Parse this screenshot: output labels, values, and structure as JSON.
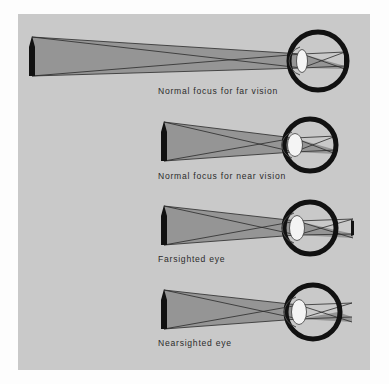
{
  "figure": {
    "panel_background": "#c9c9c9",
    "page_background": "#fdfdfd",
    "ink_color": "#1a1a1a",
    "ray_fill_color": "#8c8c8c",
    "lens_color": "#f4f4f4"
  },
  "diagrams": [
    {
      "id": "normal-far",
      "caption": "Normal focus for far vision",
      "object": {
        "x": 30,
        "top": 36,
        "bottom": 76,
        "label": "upright object (arrow)"
      },
      "eye": {
        "cx": 318,
        "cy": 61,
        "r": 31
      },
      "lens": {
        "cx": 290,
        "cy": 61,
        "rx": 5.5,
        "ry": 12,
        "shape": "thin"
      },
      "image_on_retina": {
        "x": 344,
        "top": 53,
        "bottom": 69,
        "inverted": true
      },
      "focus_location": "on retina"
    },
    {
      "id": "normal-near",
      "caption": "Normal focus for near vision",
      "object": {
        "x": 163,
        "top": 122,
        "bottom": 163,
        "label": "upright object (arrow)"
      },
      "eye": {
        "cx": 310,
        "cy": 145,
        "r": 28
      },
      "lens": {
        "cx": 291,
        "cy": 145,
        "rx": 7.5,
        "ry": 12,
        "shape": "thick"
      },
      "image_on_retina": {
        "x": 335,
        "top": 138,
        "bottom": 153,
        "inverted": true
      },
      "focus_location": "on retina"
    },
    {
      "id": "farsighted",
      "caption": "Farsighted eye",
      "object": {
        "x": 163,
        "top": 205,
        "bottom": 247,
        "label": "upright object (arrow)"
      },
      "eye": {
        "cx": 310,
        "cy": 228,
        "r": 28
      },
      "lens": {
        "cx": 293,
        "cy": 228,
        "rx": 7.5,
        "ry": 13,
        "shape": "thick"
      },
      "image_on_retina": {
        "x": 352,
        "top": 221,
        "bottom": 236,
        "inverted": true
      },
      "focus_location": "behind retina"
    },
    {
      "id": "nearsighted",
      "caption": "Nearsighted eye",
      "object": {
        "x": 163,
        "top": 289,
        "bottom": 331,
        "label": "upright object (arrow)"
      },
      "eye": {
        "cx": 313,
        "cy": 312,
        "r": 29
      },
      "lens": {
        "cx": 295,
        "cy": 312,
        "rx": 7.5,
        "ry": 13,
        "shape": "thick"
      },
      "image_on_retina": {
        "x": 350,
        "top": 305,
        "bottom": 320,
        "inverted": true
      },
      "focus_location": "in front of retina"
    }
  ]
}
